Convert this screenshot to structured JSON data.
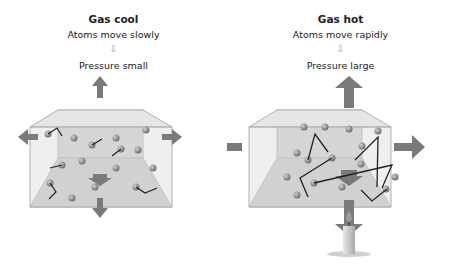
{
  "left": {
    "title": "Gas cool",
    "line1": "Atoms move slowly",
    "arrow": "⇩",
    "line2": "Pressure small"
  },
  "right": {
    "title": "Gas hot",
    "line1": "Atoms move rapidly",
    "arrow": "⇩",
    "line2": "Pressure large"
  },
  "colors": {
    "arrow": "#7a7a7a",
    "box_fill": "#d8d8d8",
    "box_edge": "#b8b8b8",
    "atom": "#8c8c8c",
    "path": "#222222"
  }
}
